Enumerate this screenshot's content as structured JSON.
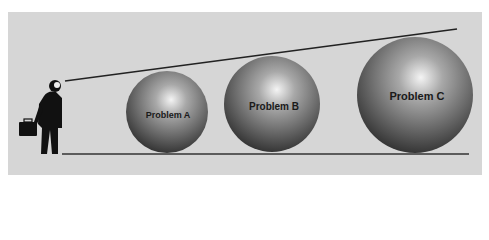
{
  "diagram": {
    "colors": {
      "background": "#d6d6d6",
      "line": "#222222",
      "figure": "#111111"
    },
    "figure": {
      "icon": "businessman-with-briefcase-icon"
    },
    "balls": [
      {
        "label": "Problem A",
        "cx": 167,
        "cy": 112,
        "r": 40,
        "font_size": 9
      },
      {
        "label": "Problem B",
        "cx": 272,
        "cy": 104,
        "r": 48,
        "font_size": 10
      },
      {
        "label": "Problem C",
        "cx": 415,
        "cy": 95,
        "r": 58,
        "font_size": 11
      }
    ]
  }
}
